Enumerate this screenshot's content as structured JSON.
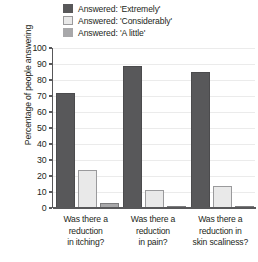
{
  "chart_data": {
    "type": "bar",
    "title": "",
    "subtitle": "",
    "xlabel": "",
    "ylabel": "Percentage of people answering",
    "ylim": [
      0,
      100
    ],
    "ytick_step": 10,
    "yticks": [
      100,
      90,
      80,
      70,
      60,
      50,
      40,
      30,
      20,
      10,
      0
    ],
    "grid": true,
    "legend_position": "top-right",
    "categories": [
      "Was there a reduction in itching?",
      "Was there a reduction in pain?",
      "Was there a reduction in skin scaliness?"
    ],
    "category_lines": [
      [
        "Was there a",
        "reduction",
        "in itching?"
      ],
      [
        "Was there a",
        "reduction",
        "in pain?"
      ],
      [
        "Was there a",
        "reduction in",
        "skin scaliness?"
      ]
    ],
    "series": [
      {
        "name": "Answered: 'Extremely'",
        "color": "#58585a",
        "values": [
          72,
          89,
          85
        ]
      },
      {
        "name": "Answered: 'Considerably'",
        "color": "#e9e9e9",
        "values": [
          24,
          11,
          14
        ]
      },
      {
        "name": "Answered: 'A little'",
        "color": "#a8a8aa",
        "values": [
          3,
          0,
          1
        ]
      }
    ]
  },
  "legend": {
    "items": [
      {
        "label": "Answered: 'Extremely'",
        "color": "#58585a"
      },
      {
        "label": "Answered: 'Considerably'",
        "color": "#e9e9e9"
      },
      {
        "label": "Answered: 'A little'",
        "color": "#a8a8aa"
      }
    ]
  },
  "axes": {
    "y_title": "Percentage of people answering",
    "y_tick_labels": [
      "100",
      "90",
      "80",
      "70",
      "60",
      "50",
      "40",
      "30",
      "20",
      "10",
      "0"
    ]
  }
}
